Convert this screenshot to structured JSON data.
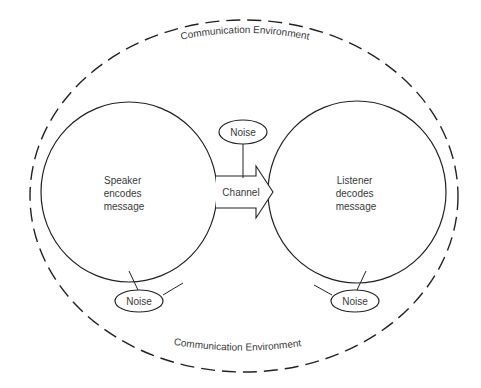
{
  "diagram": {
    "environment_top_label": "Communication Environment",
    "environment_bottom_label": "Communication Environment",
    "speaker": {
      "line1": "Speaker",
      "line2": "encodes",
      "line3": "message"
    },
    "listener": {
      "line1": "Listener",
      "line2": "decodes",
      "line3": "message"
    },
    "channel_label": "Channel",
    "noise_top": "Noise",
    "noise_left": "Noise",
    "noise_right": "Noise"
  },
  "colors": {
    "stroke": "#222222",
    "text": "#3a3a3a",
    "background": "#ffffff"
  }
}
